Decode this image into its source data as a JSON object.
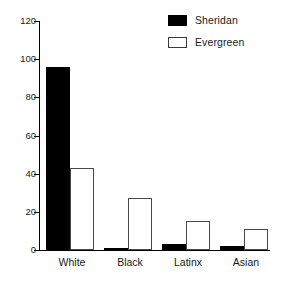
{
  "chart_data": {
    "type": "bar",
    "title": "",
    "subtitle": "",
    "xlabel": "",
    "ylabel": "",
    "categories": [
      "White",
      "Black",
      "Latinx",
      "Asian"
    ],
    "series": [
      {
        "name": "Sheridan",
        "color": "#000000",
        "fill": "solid",
        "values": [
          96,
          1,
          3,
          2
        ]
      },
      {
        "name": "Evergreen",
        "color": "#ffffff",
        "fill": "outline",
        "values": [
          43,
          27,
          15,
          11
        ]
      }
    ],
    "ylim": [
      0,
      120
    ],
    "yticks": [
      0,
      20,
      40,
      60,
      80,
      100,
      120
    ],
    "ytick_labels": [
      "0",
      "20",
      "40",
      "60",
      "80",
      "100",
      "120"
    ],
    "grid": false,
    "legend_position": "top-right",
    "legend_entries": [
      "Sheridan",
      "Evergreen"
    ]
  },
  "axis": {
    "y_tick_0": "0",
    "y_tick_20": "20",
    "y_tick_40": "40",
    "y_tick_60": "60",
    "y_tick_80": "80",
    "y_tick_100": "100",
    "y_tick_120": "120"
  },
  "legend": {
    "sheridan_label": "Sheridan",
    "evergreen_label": "Evergreen"
  },
  "categories": {
    "white": "White",
    "black": "Black",
    "latinx": "Latinx",
    "asian": "Asian"
  }
}
